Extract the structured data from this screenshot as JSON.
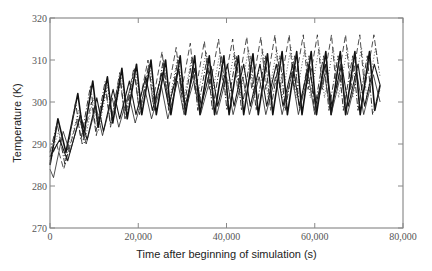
{
  "chart_data": {
    "type": "line",
    "title": "",
    "xlabel": "Time after beginning of simulation (s)",
    "ylabel": "Temperature (K)",
    "xlim": [
      0,
      80000
    ],
    "ylim": [
      270,
      320
    ],
    "xticks": [
      0,
      20000,
      40000,
      60000,
      80000
    ],
    "xtick_labels": [
      "0",
      "20,000",
      "40,000",
      "60,000",
      "80,000"
    ],
    "yticks": [
      270,
      280,
      290,
      300,
      310,
      320
    ],
    "ytick_labels": [
      "270",
      "280",
      "290",
      "300",
      "310",
      "320"
    ],
    "grid": false,
    "legend": "none",
    "period_s": 6250,
    "series": [
      {
        "name": "series-dashed-top",
        "style": "dashed",
        "color": "#222222",
        "width": 0.8,
        "points": [
          [
            0,
            286
          ],
          [
            1500,
            290
          ],
          [
            3100,
            284
          ],
          [
            6200,
            296
          ],
          [
            7300,
            290
          ],
          [
            9400,
            300
          ],
          [
            10500,
            292
          ],
          [
            12600,
            303
          ],
          [
            13700,
            295
          ],
          [
            15800,
            306
          ],
          [
            16900,
            297
          ],
          [
            19000,
            308
          ],
          [
            20100,
            299
          ],
          [
            22200,
            310
          ],
          [
            23300,
            300
          ],
          [
            25400,
            312
          ],
          [
            26500,
            301
          ],
          [
            28600,
            313
          ],
          [
            29700,
            302
          ],
          [
            31800,
            314
          ],
          [
            32900,
            302
          ],
          [
            35000,
            314.5
          ],
          [
            36100,
            303
          ],
          [
            38200,
            315
          ],
          [
            39300,
            303
          ],
          [
            41400,
            315
          ],
          [
            42500,
            303
          ],
          [
            44600,
            315.5
          ],
          [
            45700,
            303
          ],
          [
            47800,
            315.5
          ],
          [
            48900,
            303
          ],
          [
            51000,
            316
          ],
          [
            52100,
            303
          ],
          [
            54200,
            316
          ],
          [
            55300,
            303
          ],
          [
            57400,
            316
          ],
          [
            58500,
            303
          ],
          [
            60600,
            316
          ],
          [
            61700,
            303
          ],
          [
            63800,
            316
          ],
          [
            64900,
            303
          ],
          [
            67000,
            316
          ],
          [
            68100,
            303
          ],
          [
            70200,
            316
          ],
          [
            71300,
            303
          ],
          [
            73400,
            316
          ],
          [
            74500,
            308
          ]
        ]
      },
      {
        "name": "series-dotted",
        "style": "dotted",
        "color": "#333333",
        "width": 0.8,
        "points": [
          [
            0,
            287
          ],
          [
            2000,
            293
          ],
          [
            3600,
            286
          ],
          [
            6500,
            298
          ],
          [
            7800,
            290
          ],
          [
            9800,
            301
          ],
          [
            11000,
            293
          ],
          [
            13000,
            304
          ],
          [
            14200,
            295
          ],
          [
            16200,
            306
          ],
          [
            17400,
            297
          ],
          [
            19400,
            308
          ],
          [
            20600,
            298
          ],
          [
            22600,
            309
          ],
          [
            23800,
            299
          ],
          [
            25800,
            310
          ],
          [
            27000,
            300
          ],
          [
            29000,
            311
          ],
          [
            30200,
            300
          ],
          [
            32200,
            311
          ],
          [
            33400,
            301
          ],
          [
            35400,
            312
          ],
          [
            36600,
            301
          ],
          [
            38600,
            312
          ],
          [
            39800,
            301
          ],
          [
            41800,
            312
          ],
          [
            43000,
            301
          ],
          [
            45000,
            312.5
          ],
          [
            46200,
            301
          ],
          [
            48200,
            312.5
          ],
          [
            49400,
            301
          ],
          [
            51400,
            312.5
          ],
          [
            52600,
            301
          ],
          [
            54600,
            313
          ],
          [
            55800,
            301
          ],
          [
            57800,
            313
          ],
          [
            59000,
            301
          ],
          [
            61000,
            313
          ],
          [
            62200,
            301
          ],
          [
            64200,
            313
          ],
          [
            65400,
            301
          ],
          [
            67400,
            313
          ],
          [
            68600,
            301
          ],
          [
            70600,
            313
          ],
          [
            71800,
            301
          ],
          [
            73800,
            313
          ],
          [
            74800,
            306
          ]
        ]
      },
      {
        "name": "series-solid-thick",
        "style": "solid",
        "color": "#111111",
        "width": 1.6,
        "points": [
          [
            0,
            285
          ],
          [
            1800,
            296
          ],
          [
            3600,
            288
          ],
          [
            6300,
            302
          ],
          [
            7600,
            292
          ],
          [
            9700,
            305
          ],
          [
            10900,
            294
          ],
          [
            13000,
            306
          ],
          [
            14200,
            295
          ],
          [
            16300,
            308
          ],
          [
            17500,
            296
          ],
          [
            19600,
            309
          ],
          [
            20800,
            297
          ],
          [
            22900,
            310
          ],
          [
            24100,
            297
          ],
          [
            26200,
            310
          ],
          [
            27400,
            297
          ],
          [
            29500,
            311
          ],
          [
            30700,
            297
          ],
          [
            32800,
            311
          ],
          [
            34000,
            297
          ],
          [
            36100,
            311
          ],
          [
            37300,
            297
          ],
          [
            39400,
            311
          ],
          [
            40600,
            297
          ],
          [
            42700,
            311
          ],
          [
            43900,
            297
          ],
          [
            46000,
            311.5
          ],
          [
            47200,
            297
          ],
          [
            49300,
            311.5
          ],
          [
            50500,
            297
          ],
          [
            52600,
            312
          ],
          [
            53800,
            297
          ],
          [
            55900,
            312
          ],
          [
            57100,
            297
          ],
          [
            59200,
            312
          ],
          [
            60400,
            297
          ],
          [
            62500,
            312
          ],
          [
            63700,
            297
          ],
          [
            65800,
            312
          ],
          [
            67000,
            297
          ],
          [
            69100,
            312
          ],
          [
            70300,
            297
          ],
          [
            72400,
            312
          ],
          [
            73600,
            298
          ],
          [
            74800,
            304
          ]
        ]
      },
      {
        "name": "series-solid-thin",
        "style": "solid",
        "color": "#222222",
        "width": 0.8,
        "points": [
          [
            0,
            284
          ],
          [
            800,
            282
          ],
          [
            3000,
            293
          ],
          [
            4500,
            288
          ],
          [
            6700,
            296
          ],
          [
            8200,
            290
          ],
          [
            10400,
            299
          ],
          [
            11900,
            292
          ],
          [
            14100,
            301
          ],
          [
            15600,
            294
          ],
          [
            17800,
            302
          ],
          [
            19300,
            295
          ],
          [
            21500,
            303
          ],
          [
            23000,
            296
          ],
          [
            25200,
            304
          ],
          [
            26700,
            296
          ],
          [
            28900,
            305
          ],
          [
            30400,
            297
          ],
          [
            32600,
            305
          ],
          [
            34100,
            297
          ],
          [
            36300,
            305.5
          ],
          [
            37800,
            297
          ],
          [
            40000,
            306
          ],
          [
            41500,
            297
          ],
          [
            43700,
            306
          ],
          [
            45200,
            297
          ],
          [
            47400,
            306
          ],
          [
            48900,
            297
          ],
          [
            51100,
            306
          ],
          [
            52600,
            297
          ],
          [
            54800,
            306.5
          ],
          [
            56300,
            297
          ],
          [
            58500,
            306.5
          ],
          [
            60000,
            297
          ],
          [
            62200,
            306.5
          ],
          [
            63700,
            297
          ],
          [
            65900,
            306.5
          ],
          [
            67400,
            297
          ],
          [
            69600,
            306.5
          ],
          [
            71100,
            297
          ],
          [
            73300,
            306.5
          ],
          [
            74800,
            300
          ]
        ]
      },
      {
        "name": "series-dash-dot",
        "style": "dashdot",
        "color": "#333333",
        "width": 1.0,
        "points": [
          [
            0,
            288
          ],
          [
            1600,
            295
          ],
          [
            3400,
            285
          ],
          [
            5800,
            300
          ],
          [
            7000,
            291
          ],
          [
            9200,
            304
          ],
          [
            10400,
            293
          ],
          [
            12500,
            305
          ],
          [
            13700,
            294
          ],
          [
            15800,
            307
          ],
          [
            17000,
            296
          ],
          [
            19100,
            308
          ],
          [
            20300,
            297
          ],
          [
            22400,
            309
          ],
          [
            23600,
            298
          ],
          [
            25700,
            310
          ],
          [
            26900,
            298
          ],
          [
            29000,
            310
          ],
          [
            30200,
            298
          ],
          [
            32300,
            310.5
          ],
          [
            33500,
            298
          ],
          [
            35600,
            310.5
          ],
          [
            36800,
            298
          ],
          [
            38900,
            311
          ],
          [
            40100,
            298
          ],
          [
            42200,
            311
          ],
          [
            43400,
            298
          ],
          [
            45500,
            311
          ],
          [
            46700,
            298
          ],
          [
            48800,
            311
          ],
          [
            50000,
            298
          ],
          [
            52100,
            311
          ],
          [
            53300,
            298
          ],
          [
            55400,
            311
          ],
          [
            56600,
            298
          ],
          [
            58700,
            311
          ],
          [
            59900,
            298
          ],
          [
            62000,
            311
          ],
          [
            63200,
            298
          ],
          [
            65300,
            311
          ],
          [
            66500,
            298
          ],
          [
            68600,
            311
          ],
          [
            69800,
            298
          ],
          [
            71900,
            311
          ],
          [
            73100,
            297
          ],
          [
            74800,
            303
          ]
        ]
      },
      {
        "name": "series-solid-mid",
        "style": "solid",
        "color": "#1a1a1a",
        "width": 1.1,
        "points": [
          [
            0,
            287
          ],
          [
            2200,
            291
          ],
          [
            4000,
            286
          ],
          [
            6900,
            297
          ],
          [
            8400,
            291
          ],
          [
            10600,
            301
          ],
          [
            12100,
            293
          ],
          [
            14300,
            303
          ],
          [
            15800,
            296
          ],
          [
            18000,
            305
          ],
          [
            19500,
            297
          ],
          [
            21700,
            306
          ],
          [
            23200,
            298
          ],
          [
            25400,
            307
          ],
          [
            26900,
            299
          ],
          [
            29100,
            308
          ],
          [
            30600,
            299
          ],
          [
            32800,
            308
          ],
          [
            34300,
            299
          ],
          [
            36500,
            308.5
          ],
          [
            38000,
            299
          ],
          [
            40200,
            309
          ],
          [
            41700,
            299
          ],
          [
            43900,
            309
          ],
          [
            45400,
            299
          ],
          [
            47600,
            309
          ],
          [
            49100,
            299
          ],
          [
            51300,
            309
          ],
          [
            52800,
            299
          ],
          [
            55000,
            309
          ],
          [
            56500,
            299
          ],
          [
            58700,
            309
          ],
          [
            60200,
            299
          ],
          [
            62400,
            309
          ],
          [
            63900,
            299
          ],
          [
            66100,
            309
          ],
          [
            67600,
            299
          ],
          [
            69800,
            309
          ],
          [
            71300,
            299
          ],
          [
            73500,
            309
          ],
          [
            74800,
            304
          ]
        ]
      }
    ]
  }
}
